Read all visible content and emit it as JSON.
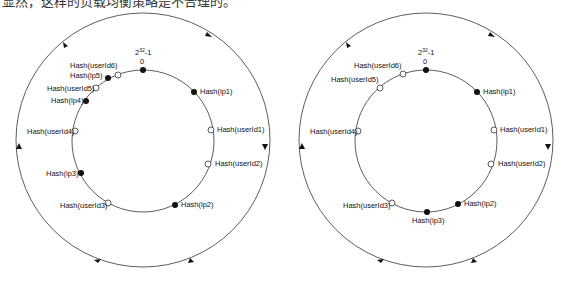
{
  "caption": "显然，这样的负载均衡策略是不合理的。",
  "colors": {
    "line": "#333333",
    "node_fill": "#111111",
    "user_fill": "#ffffff"
  },
  "diagrams": [
    {
      "id": "left",
      "top_label": "2^32-1",
      "zero_label": "0",
      "nodes": [
        {
          "label": "Hash(ip1)",
          "type": "server"
        },
        {
          "label": "Hash(userId1)",
          "type": "user"
        },
        {
          "label": "Hash(userId2)",
          "type": "user"
        },
        {
          "label": "Hash(ip2)",
          "type": "server"
        },
        {
          "label": "Hash(userId3)",
          "type": "user"
        },
        {
          "label": "Hash(ip3)",
          "type": "server"
        },
        {
          "label": "Hash(userId4)",
          "type": "user"
        },
        {
          "label": "Hash(ip4)",
          "type": "server"
        },
        {
          "label": "Hash(userId5)",
          "type": "user"
        },
        {
          "label": "Hash(ip5)",
          "type": "server"
        },
        {
          "label": "Hash(userId6)",
          "type": "user"
        }
      ]
    },
    {
      "id": "right",
      "top_label": "2^32-1",
      "zero_label": "0",
      "nodes": [
        {
          "label": "Hash(ip1)",
          "type": "server"
        },
        {
          "label": "Hash(userId1)",
          "type": "user"
        },
        {
          "label": "Hash(userId2)",
          "type": "user"
        },
        {
          "label": "Hash(ip2)",
          "type": "server"
        },
        {
          "label": "Hash(ip3)",
          "type": "server"
        },
        {
          "label": "Hash(userId3)",
          "type": "user"
        },
        {
          "label": "Hash(userId4)",
          "type": "user"
        },
        {
          "label": "Hash(userId5)",
          "type": "user"
        },
        {
          "label": "Hash(userId6)",
          "type": "user"
        }
      ]
    }
  ]
}
